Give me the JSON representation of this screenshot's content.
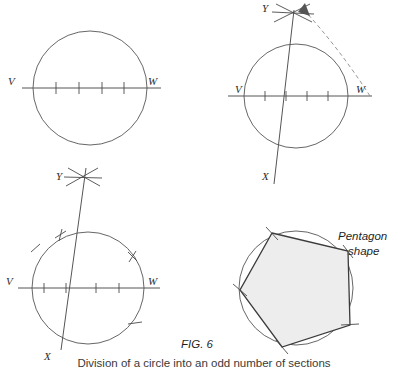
{
  "figure": {
    "number_label": "FIG. 6",
    "caption": "Division of a circle into an odd number of sections",
    "pentagon_label_line1": "Pentagon",
    "pentagon_label_line2": "shape"
  },
  "colors": {
    "ink": "#4a4a4a",
    "ink_dark": "#1f1f1f",
    "construction_dashed": "#8a8a8a",
    "polygon_stroke": "#3b3b3b",
    "polygon_fill": "#ededed",
    "background": "#ffffff"
  },
  "panels": [
    {
      "id": "step-1",
      "name": "circle-with-divided-diameter",
      "labels": {
        "left": "V",
        "right": "W"
      },
      "divisions": 5,
      "tick_count": 4
    },
    {
      "id": "step-2",
      "name": "circle-with-perpendicular-bisector-arcs",
      "labels": {
        "left": "V",
        "right": "W",
        "top": "Y",
        "bottom": "X"
      },
      "divisions": 5,
      "tick_count": 4
    },
    {
      "id": "step-3",
      "name": "circle-with-stepped-off-chords",
      "labels": {
        "left": "V",
        "right": "W",
        "top": "Y",
        "bottom": "X"
      },
      "divisions": 5,
      "tick_count": 4,
      "circumference_marks": 4
    },
    {
      "id": "step-4",
      "name": "inscribed-pentagon",
      "labels": {
        "shape": "Pentagon shape"
      },
      "sides": 5,
      "vertex_marks": 5
    }
  ]
}
